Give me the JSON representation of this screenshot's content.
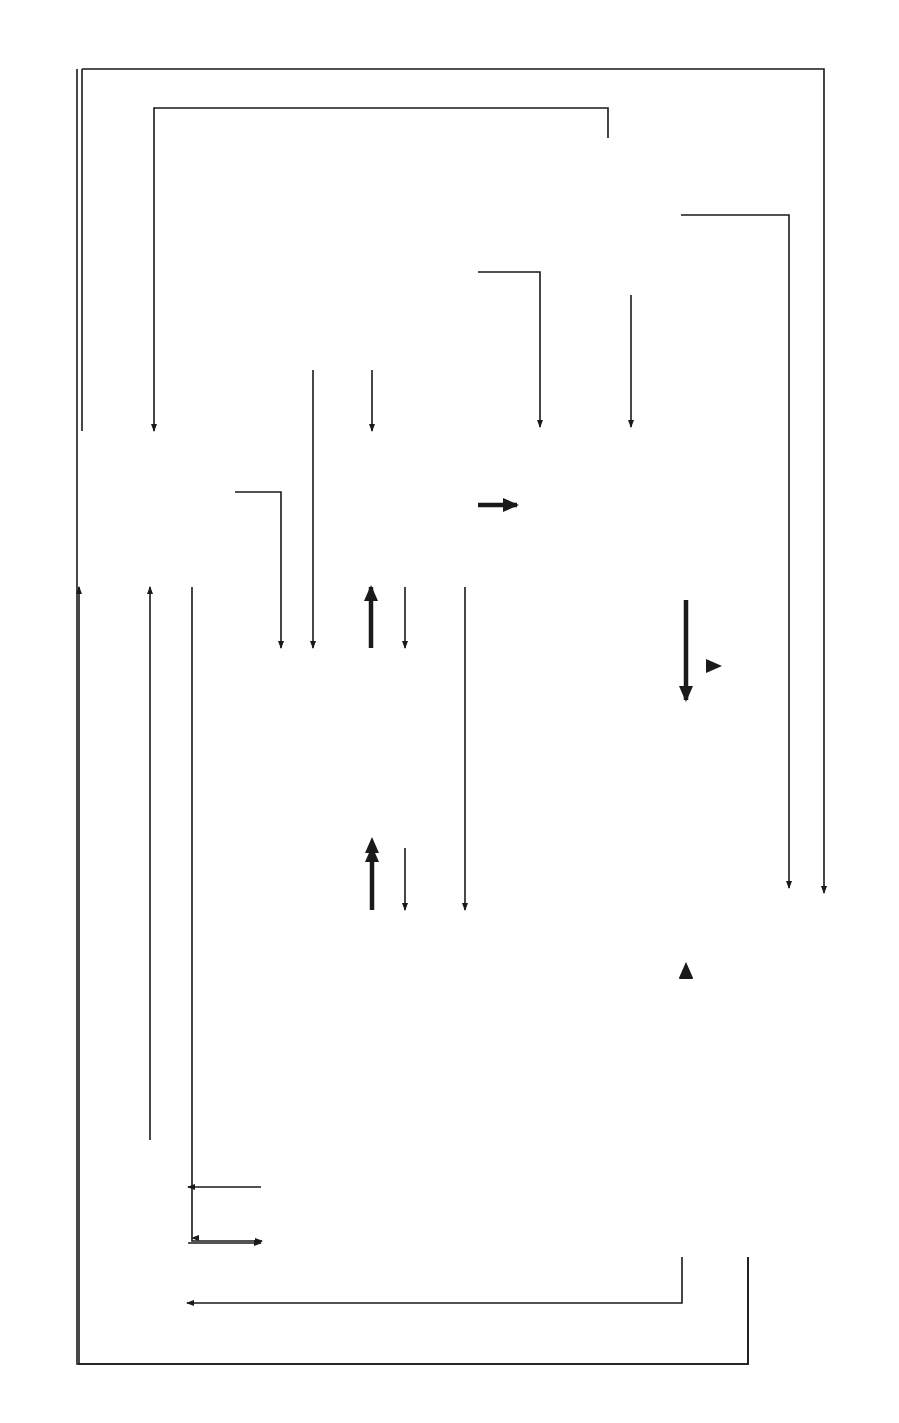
{
  "figure": {
    "caption": "FIGURE 1.1",
    "orientation": "rotated 90° counter-clockwise (landscape page)"
  },
  "nodes": {
    "outside_forces": {
      "title": "Outside Forces",
      "items": [
        "Financial",
        "Social",
        "Political",
        "Legal",
        "Personal",
        "Career"
      ]
    },
    "data_other_sources": {
      "lines": [
        "Data from",
        "other",
        "sources"
      ]
    },
    "professional_literature": {
      "lines": [
        "Professional",
        "Literature"
      ]
    },
    "data_collected": {
      "lines": [
        "Data",
        "Collected"
      ]
    },
    "data_analyzed": {
      "lines": [
        "Data",
        "Analyzed"
      ],
      "icon": "computer-icon"
    },
    "research_plan": {
      "title": "Research Plan",
      "items": [
        "Data collection",
        "Data analysis",
        "Reporting"
      ]
    },
    "inference": {
      "label": "Inference",
      "icon": "human-head-icon"
    },
    "research_mission": {
      "title": "Research Mission",
      "items": [
        "Questions",
        "Hypotheses",
        "Reasons for seeking answers"
      ]
    },
    "theory_practice": {
      "lines": [
        "Theory and",
        "Practice"
      ]
    },
    "project_report": {
      "title": "Project Report",
      "items": [
        "Procedures",
        "Results",
        "Descriptive statements",
        "Answers to mission"
      ]
    }
  },
  "edges": [
    {
      "from": "Outside Forces",
      "to": "Research Plan"
    },
    {
      "from": "Outside Forces",
      "to": "Data Collected"
    },
    {
      "from": "Outside Forces",
      "to": "Data Analyzed"
    },
    {
      "from": "Data from other sources",
      "to": "Professional Literature"
    },
    {
      "from": "Data from other sources",
      "to": "Data Analyzed"
    },
    {
      "from": "Data from other sources",
      "to": "Inference"
    },
    {
      "from": "Professional Literature",
      "to": "Research Plan"
    },
    {
      "from": "Professional Literature",
      "to": "Research Mission"
    },
    {
      "from": "Professional Literature",
      "to": "Inference"
    },
    {
      "from": "Research Plan",
      "to": "Data Collected",
      "weight": "bold"
    },
    {
      "from": "Data Collected",
      "to": "Research Plan"
    },
    {
      "from": "Data Collected",
      "to": "Research Mission"
    },
    {
      "from": "Data Collected",
      "to": "Data Analyzed",
      "weight": "bold"
    },
    {
      "from": "Research Mission",
      "to": "Research Plan",
      "weight": "bold"
    },
    {
      "from": "Research Plan",
      "to": "Research Mission"
    },
    {
      "from": "Data Analyzed",
      "to": "Inference",
      "weight": "bold"
    },
    {
      "from": "Inference",
      "to": "Project Report",
      "weight": "bold"
    },
    {
      "from": "Project Report",
      "to": "Research Mission",
      "weight": "bold"
    },
    {
      "from": "Project Report",
      "to": "Theory and Practice"
    },
    {
      "from": "Project Report",
      "to": "Professional Literature"
    },
    {
      "from": "Research Mission",
      "to": "Theory and Practice"
    },
    {
      "from": "Theory and Practice",
      "to": "Research Mission"
    },
    {
      "from": "Theory and Practice",
      "to": "Professional Literature"
    }
  ],
  "colors": {
    "line": "#1a1a1a",
    "fill_screen": "#a9a9a9",
    "fill_head": "#a0a0a0",
    "background": "#ffffff"
  }
}
